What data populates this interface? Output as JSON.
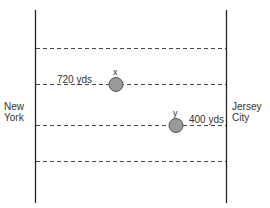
{
  "diagram": {
    "left_bank": {
      "label_line1": "New",
      "label_line2": "York"
    },
    "right_bank": {
      "label_line1": "Jersey",
      "label_line2": "City"
    },
    "lanes": [
      {
        "y": 48
      },
      {
        "y": 84
      },
      {
        "y": 125
      },
      {
        "y": 161
      }
    ],
    "points": [
      {
        "name": "x",
        "label": "x",
        "cx": 116,
        "cy": 84,
        "distance_label": "720 yds"
      },
      {
        "name": "y",
        "label": "y",
        "cx": 176,
        "cy": 125,
        "distance_label": "400 yds"
      }
    ],
    "colors": {
      "line": "#222222",
      "dash": "#333333",
      "circle_fill": "#9a9a9a",
      "circle_stroke": "#555555"
    }
  }
}
